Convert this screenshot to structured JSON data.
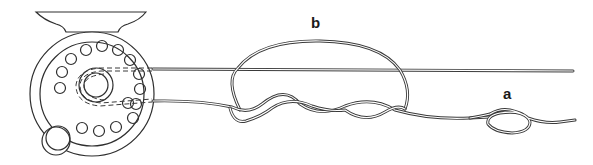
{
  "diagram": {
    "type": "illustration",
    "labels": {
      "b": "b",
      "a": "a"
    },
    "colors": {
      "line": "#3a3a3a",
      "background": "#ffffff"
    },
    "parts": [
      {
        "id": "reel",
        "name": "fly reel with foot, perforated spool and handle knob"
      },
      {
        "id": "upper-line",
        "name": "line leaving reel (upper)"
      },
      {
        "id": "lower-line",
        "name": "line leaving reel (lower)"
      },
      {
        "id": "knot-b",
        "label": "b",
        "name": "looped twisted knot joining lines"
      },
      {
        "id": "knot-a",
        "label": "a",
        "name": "small overhand-style knot at line end"
      }
    ]
  }
}
